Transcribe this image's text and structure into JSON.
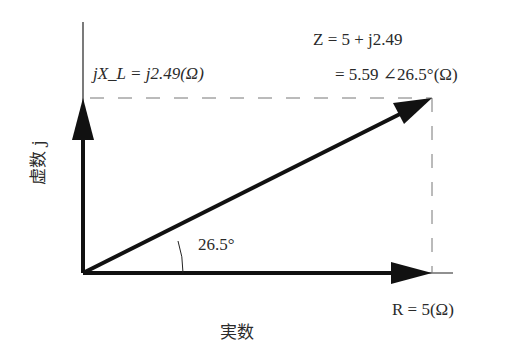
{
  "diagram": {
    "type": "impedance-phasor-diagram",
    "impedance_label_line1": "Z = 5 + j2.49",
    "impedance_label_line2": "= 5.59 ∠26.5°(Ω)",
    "reactance_label": "jX_L = j2.49(Ω)",
    "resistance_label": "R = 5(Ω)",
    "angle_label": "26.5°",
    "x_axis_label": "実数",
    "y_axis_label": "虚数 j",
    "values": {
      "R": 5,
      "X_L": 2.49,
      "Z_magnitude": 5.59,
      "phase_deg": 26.5
    },
    "colors": {
      "vector": "#111111",
      "dashed": "#777777",
      "text": "#2a2a2a"
    }
  }
}
